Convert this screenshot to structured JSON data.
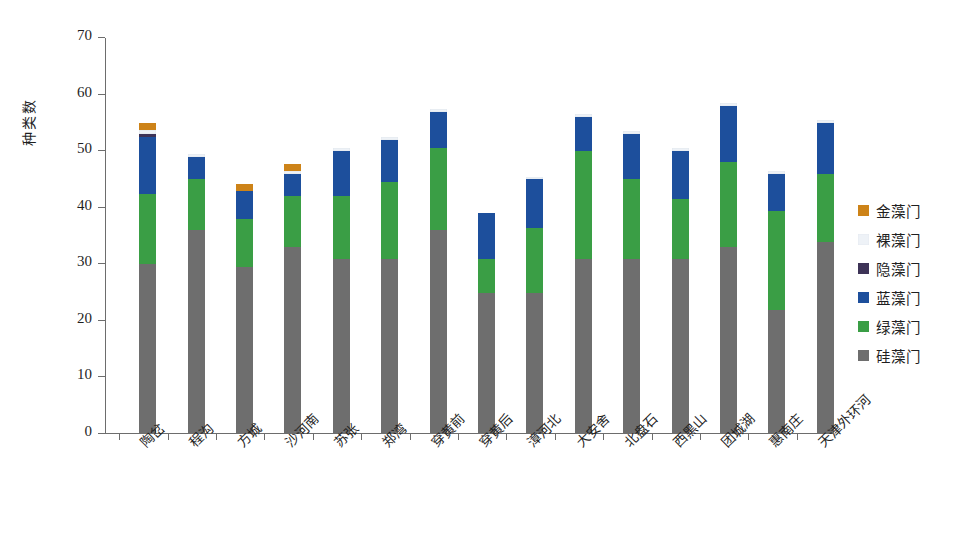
{
  "chart_data": {
    "type": "bar",
    "subtype": "stacked-bar",
    "title": "",
    "xlabel": "",
    "ylabel": "种类数",
    "ylim": [
      0,
      70
    ],
    "yticks": [
      0,
      10,
      20,
      30,
      40,
      50,
      60,
      70
    ],
    "grid": false,
    "legend_position": "right",
    "categories": [
      "陶岔",
      "程沟",
      "方城",
      "沙河南",
      "苏张",
      "郑湾",
      "穿黄前",
      "穿黄后",
      "漳河北",
      "大安舍",
      "北盘石",
      "西黑山",
      "团城湖",
      "惠南庄",
      "天津外环河"
    ],
    "series": [
      {
        "name": "硅藻门",
        "color": "#6e6e6e",
        "values": [
          30,
          36,
          29.5,
          33,
          31,
          31,
          36,
          25,
          25,
          31,
          31,
          31,
          33,
          22,
          34
        ]
      },
      {
        "name": "绿藻门",
        "color": "#3a9e45",
        "values": [
          12.5,
          9,
          8.5,
          9,
          11,
          13.5,
          14.5,
          6,
          11.5,
          19,
          14,
          10.5,
          15,
          17.5,
          12
        ]
      },
      {
        "name": "蓝藻门",
        "color": "#1d4f9c",
        "values": [
          10,
          4,
          5,
          4,
          8,
          7.5,
          6.5,
          8,
          8.5,
          6,
          8,
          8.5,
          10,
          6.5,
          9
        ]
      },
      {
        "name": "隐藻门",
        "color": "#3d3357",
        "values": [
          0.5,
          0,
          0,
          0,
          0,
          0,
          0,
          0,
          0,
          0,
          0,
          0,
          0,
          0,
          0
        ]
      },
      {
        "name": "裸藻门",
        "color": "#eef2f7",
        "values": [
          0.7,
          0.5,
          0,
          0.5,
          0.5,
          0.5,
          0.5,
          0,
          0.5,
          0.5,
          0.5,
          0.5,
          0.5,
          0.5,
          0.5
        ]
      },
      {
        "name": "金藻门",
        "color": "#cd8318",
        "values": [
          1.2,
          0,
          1.2,
          1.2,
          0,
          0,
          0,
          0,
          0,
          0,
          0,
          0,
          0,
          0,
          0
        ]
      }
    ],
    "totals": [
      55,
      49,
      46,
      48,
      50.5,
      52.5,
      57.5,
      39,
      45.5,
      56.5,
      53.5,
      50.5,
      58.5,
      46.5,
      55.5
    ],
    "legend_entries": [
      {
        "label": "金藻门",
        "color": "#cd8318"
      },
      {
        "label": "裸藻门",
        "color": "#eef2f7"
      },
      {
        "label": "隐藻门",
        "color": "#3d3357"
      },
      {
        "label": "蓝藻门",
        "color": "#1d4f9c"
      },
      {
        "label": "绿藻门",
        "color": "#3a9e45"
      },
      {
        "label": "硅藻门",
        "color": "#6e6e6e"
      }
    ]
  },
  "axis": {
    "y_title": "种类数"
  }
}
